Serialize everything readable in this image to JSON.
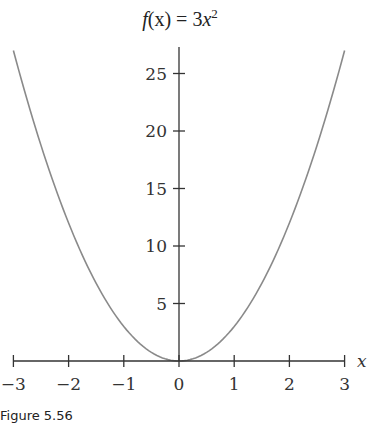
{
  "chart_data": {
    "type": "line",
    "title_parts": {
      "func": "f",
      "arg": "(x)",
      "eq": " = 3",
      "var": "x",
      "exp": "2"
    },
    "xlabel": "x",
    "ylabel": "",
    "xlim": [
      -3,
      3
    ],
    "ylim": [
      0,
      27.5
    ],
    "x_ticks": [
      -3,
      -2,
      -1,
      0,
      1,
      2,
      3
    ],
    "x_tick_labels": [
      "−3",
      "−2",
      "−1",
      "0",
      "1",
      "2",
      "3"
    ],
    "y_ticks": [
      5,
      10,
      15,
      20,
      25
    ],
    "y_tick_labels": [
      "5",
      "10",
      "15",
      "20",
      "25"
    ],
    "grid": false,
    "legend": null,
    "series": [
      {
        "name": "f(x) = 3x^2",
        "color": "#8a8a8a",
        "x": [
          -3,
          -2.5,
          -2,
          -1.5,
          -1,
          -0.5,
          0,
          0.5,
          1,
          1.5,
          2,
          2.5,
          3
        ],
        "values": [
          27,
          18.75,
          12,
          6.75,
          3,
          0.75,
          0,
          0.75,
          3,
          6.75,
          12,
          18.75,
          27
        ]
      }
    ]
  },
  "caption": "Figure 5.56"
}
